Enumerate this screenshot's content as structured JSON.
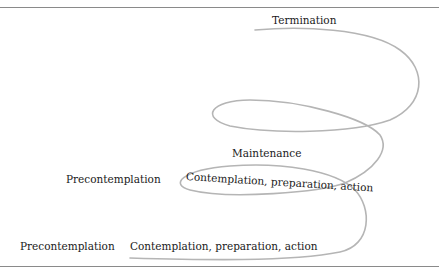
{
  "diagram": {
    "stroke_color": "#b5b5b5",
    "rule_color": "#8a8a8a",
    "nodes": [
      {
        "id": "termination",
        "label": "Termination"
      },
      {
        "id": "maintenance",
        "label": "Maintenance"
      },
      {
        "id": "precontemplation_upper",
        "label": "Precontemplation"
      },
      {
        "id": "contemplation_upper",
        "label": "Contemplation, preparation, action"
      },
      {
        "id": "precontemplation_lower",
        "label": "Precontemplation"
      },
      {
        "id": "contemplation_lower",
        "label": "Contemplation, preparation, action"
      }
    ],
    "edges": [
      {
        "from": "precontemplation_lower",
        "to": "contemplation_lower",
        "kind": "spiral-start"
      },
      {
        "from": "contemplation_lower",
        "to": "contemplation_upper",
        "kind": "spiral-loop"
      },
      {
        "from": "contemplation_upper",
        "to": "maintenance",
        "kind": "spiral-loop"
      },
      {
        "from": "maintenance",
        "to": "termination",
        "kind": "spiral-loop"
      }
    ]
  }
}
